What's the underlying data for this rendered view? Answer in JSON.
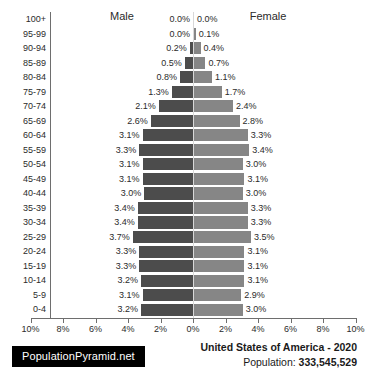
{
  "headers": {
    "male": "Male",
    "female": "Female"
  },
  "footer": {
    "logo": "PopulationPyramid.net",
    "country_year": "United States of America - 2020",
    "population_label": "Population: ",
    "population_value": "333,545,529"
  },
  "axis": {
    "tick_labels": [
      "10%",
      "8%",
      "6%",
      "4%",
      "2%",
      "0%",
      "2%",
      "4%",
      "6%",
      "8%",
      "10%"
    ],
    "tick_values": [
      -10,
      -8,
      -6,
      -4,
      -2,
      0,
      2,
      4,
      6,
      8,
      10
    ],
    "max_percent": 10
  },
  "colors": {
    "male_bar": "#4c4c4c",
    "female_bar": "#868686",
    "axis": "#6e6e6e",
    "center_line": "#d8d8d8",
    "text": "#2b2b2b",
    "logo_background": "#000000",
    "logo_text": "#ffffff"
  },
  "chart_data": {
    "type": "bar",
    "title": "United States of America - 2020",
    "subtitle": "Population: 333,545,529",
    "xlabel": "",
    "ylabel": "",
    "xlim": [
      -10,
      10
    ],
    "grid": false,
    "legend": [
      "Male",
      "Female"
    ],
    "legend_position": "top",
    "orientation": "horizontal-diverging",
    "categories": [
      "100+",
      "95-99",
      "90-94",
      "85-89",
      "80-84",
      "75-79",
      "70-74",
      "65-69",
      "60-64",
      "55-59",
      "50-54",
      "45-49",
      "40-44",
      "35-39",
      "30-34",
      "25-29",
      "20-24",
      "15-19",
      "10-14",
      "5-9",
      "0-4"
    ],
    "series": [
      {
        "name": "Male",
        "values": [
          0.0,
          0.0,
          0.2,
          0.5,
          0.8,
          1.3,
          2.1,
          2.6,
          3.1,
          3.3,
          3.1,
          3.1,
          3.0,
          3.4,
          3.4,
          3.7,
          3.3,
          3.3,
          3.2,
          3.1,
          3.2
        ],
        "labels": [
          "0.0%",
          "0.0%",
          "0.2%",
          "0.5%",
          "0.8%",
          "1.3%",
          "2.1%",
          "2.6%",
          "3.1%",
          "3.3%",
          "3.1%",
          "3.1%",
          "3.0%",
          "3.4%",
          "3.4%",
          "3.7%",
          "3.3%",
          "3.3%",
          "3.2%",
          "3.1%",
          "3.2%"
        ]
      },
      {
        "name": "Female",
        "values": [
          0.0,
          0.1,
          0.4,
          0.7,
          1.1,
          1.7,
          2.4,
          2.8,
          3.3,
          3.4,
          3.0,
          3.1,
          3.0,
          3.3,
          3.3,
          3.5,
          3.1,
          3.1,
          3.1,
          2.9,
          3.0
        ],
        "labels": [
          "0.0%",
          "0.1%",
          "0.4%",
          "0.7%",
          "1.1%",
          "1.7%",
          "2.4%",
          "2.8%",
          "3.3%",
          "3.4%",
          "3.0%",
          "3.1%",
          "3.0%",
          "3.3%",
          "3.3%",
          "3.5%",
          "3.1%",
          "3.1%",
          "3.1%",
          "2.9%",
          "3.0%"
        ]
      }
    ]
  }
}
